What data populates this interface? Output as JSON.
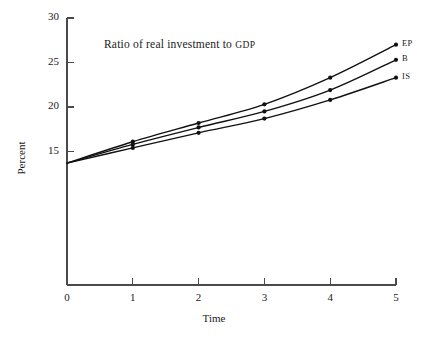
{
  "chart_data": {
    "type": "line",
    "title": "Ratio of real investment to GDP",
    "title_main": "Ratio of real investment to ",
    "title_smallcaps": "GDP",
    "xlabel": "Time",
    "ylabel": "Percent",
    "x": [
      0,
      1,
      2,
      3,
      4,
      5
    ],
    "xlim": [
      0,
      5
    ],
    "ylim": [
      0,
      30
    ],
    "xticks": [
      "0",
      "1",
      "2",
      "3",
      "4",
      "5"
    ],
    "yticks": [
      "15",
      "20",
      "25",
      "30"
    ],
    "ytick_values": [
      15,
      20,
      25,
      30
    ],
    "grid": false,
    "legend_position": "line-end-labels",
    "line_color": "#111111",
    "axis_color": "#4a4a4a",
    "series": [
      {
        "name": "EP",
        "label": "EP",
        "values": [
          13.7,
          16.1,
          18.2,
          20.3,
          23.3,
          27.0
        ]
      },
      {
        "name": "B",
        "label": "B",
        "values": [
          13.7,
          15.8,
          17.7,
          19.5,
          21.9,
          25.3
        ]
      },
      {
        "name": "IS",
        "label": "IS",
        "values": [
          13.7,
          15.4,
          17.1,
          18.7,
          20.8,
          23.3
        ]
      }
    ]
  }
}
